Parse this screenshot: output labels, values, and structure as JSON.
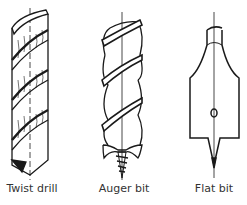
{
  "figures": [
    {
      "id": "twist-drill",
      "label": "Twist drill",
      "icon": "twist-drill-icon"
    },
    {
      "id": "auger-bit",
      "label": "Auger bit",
      "icon": "auger-bit-icon"
    },
    {
      "id": "flat-bit",
      "label": "Flat bit",
      "icon": "flat-bit-icon"
    }
  ],
  "colors": {
    "line": "#1a1a1a",
    "background": "#ffffff",
    "label": "#333333"
  }
}
